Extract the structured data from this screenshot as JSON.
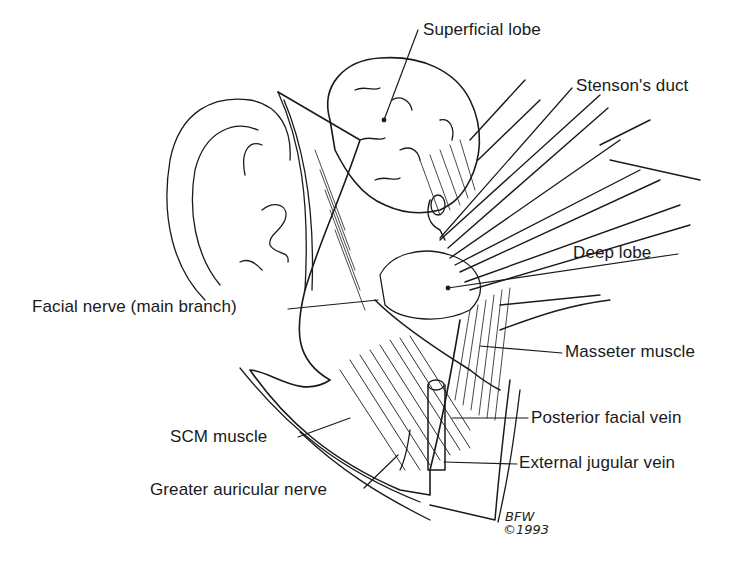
{
  "diagram": {
    "labels": {
      "superficial_lobe": "Superficial lobe",
      "stensons_duct": "Stenson's duct",
      "deep_lobe": "Deep lobe",
      "facial_nerve": "Facial nerve (main branch)",
      "masseter_muscle": "Masseter muscle",
      "scm_muscle": "SCM muscle",
      "posterior_facial_vein": "Posterior facial vein",
      "external_jugular_vein": "External jugular vein",
      "greater_auricular_nerve": "Greater auricular nerve"
    },
    "signature": {
      "initials": "BFW",
      "year": "©1993"
    },
    "colors": {
      "ink": "#1a1a1a",
      "background": "#ffffff"
    }
  }
}
